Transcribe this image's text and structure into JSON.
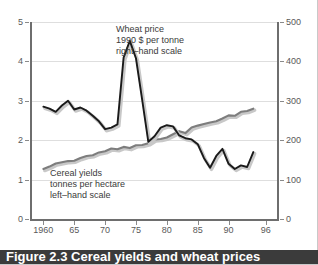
{
  "caption": {
    "text": "Figure 2.3 Cereal yields and wheat prices"
  },
  "colors": {
    "wheat_line": "#1a1a1a",
    "yields_line": "#7d7d7d",
    "shadow": "#c8c8c8",
    "gridline": "#dedede",
    "axis": "#6e6e6e",
    "tick_label": "#595959",
    "annotation_text": "#3a3a3a",
    "caption_bar": "#3b3b3b",
    "background": "#ffffff"
  },
  "annotations": {
    "wheat": {
      "line1": "Wheat price",
      "line2": "1990 $ per tonne",
      "line3": "right–hand scale"
    },
    "yields": {
      "line1": "Cereal yields",
      "line2": "tonnes per hectare",
      "line3": "left–hand scale"
    }
  },
  "axes": {
    "left_ticks": [
      "0",
      "1",
      "2",
      "3",
      "4",
      "5"
    ],
    "right_ticks": [
      "0",
      "100",
      "200",
      "300",
      "400",
      "500"
    ],
    "x_ticks": [
      "1960",
      "65",
      "70",
      "75",
      "80",
      "85",
      "90",
      "96"
    ]
  },
  "chart_data": {
    "type": "line",
    "title": "Figure 2.3 Cereal yields and wheat prices",
    "xlabel": "",
    "ylabel": "tonnes per hectare",
    "y2label": "1990 $ per tonne",
    "xlim": [
      1958,
      1998
    ],
    "ylim": [
      0,
      5
    ],
    "y2lim": [
      0,
      500
    ],
    "grid": true,
    "legend": "annotations-inline",
    "x_ticks": [
      1960,
      1965,
      1970,
      1975,
      1980,
      1985,
      1990,
      1996
    ],
    "x_tick_labels": [
      "1960",
      "65",
      "70",
      "75",
      "80",
      "85",
      "90",
      "96"
    ],
    "y_ticks": [
      0,
      1,
      2,
      3,
      4,
      5
    ],
    "y2_ticks": [
      0,
      100,
      200,
      300,
      400,
      500
    ],
    "series": [
      {
        "name": "Wheat price",
        "units": "1990 $ per tonne",
        "axis": "right",
        "color": "#1a1a1a",
        "x": [
          1960,
          1961,
          1962,
          1963,
          1964,
          1965,
          1966,
          1967,
          1968,
          1969,
          1970,
          1971,
          1972,
          1973,
          1974,
          1975,
          1976,
          1977,
          1978,
          1979,
          1980,
          1981,
          1982,
          1983,
          1984,
          1985,
          1986,
          1987,
          1988,
          1989,
          1990,
          1991,
          1992,
          1993,
          1994
        ],
        "values": [
          285,
          280,
          272,
          288,
          300,
          278,
          283,
          275,
          262,
          248,
          228,
          232,
          240,
          410,
          452,
          408,
          303,
          196,
          210,
          232,
          238,
          235,
          212,
          205,
          202,
          190,
          155,
          130,
          160,
          178,
          140,
          127,
          136,
          132,
          170
        ]
      },
      {
        "name": "Cereal yields",
        "units": "tonnes per hectare",
        "axis": "left",
        "color": "#7d7d7d",
        "x": [
          1960,
          1961,
          1962,
          1963,
          1964,
          1965,
          1966,
          1967,
          1968,
          1969,
          1970,
          1971,
          1972,
          1973,
          1974,
          1975,
          1976,
          1977,
          1978,
          1979,
          1980,
          1981,
          1982,
          1983,
          1984,
          1985,
          1986,
          1987,
          1988,
          1989,
          1990,
          1991,
          1992,
          1993,
          1994
        ],
        "values": [
          1.27,
          1.33,
          1.41,
          1.44,
          1.47,
          1.48,
          1.55,
          1.6,
          1.62,
          1.69,
          1.72,
          1.79,
          1.77,
          1.83,
          1.8,
          1.87,
          1.88,
          1.92,
          2.02,
          2.03,
          2.07,
          2.15,
          2.23,
          2.18,
          2.32,
          2.37,
          2.41,
          2.45,
          2.48,
          2.55,
          2.63,
          2.62,
          2.72,
          2.74,
          2.8
        ]
      }
    ]
  }
}
